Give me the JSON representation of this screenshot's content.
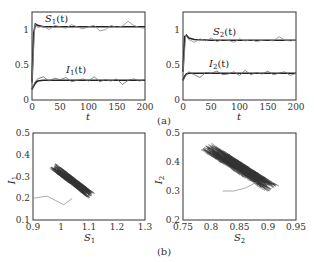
{
  "chart_data": [
    {
      "id": "a-left",
      "type": "line",
      "xlabel": "t",
      "ylabel": "",
      "xlim": [
        0,
        200
      ],
      "ylim": [
        0,
        1.25
      ],
      "xticks": [
        "0",
        "50",
        "100",
        "150",
        "200"
      ],
      "yticks": [
        "0",
        "0.5",
        "1"
      ],
      "annotations": [
        "S1(t)",
        "I1(t)"
      ],
      "series": [
        {
          "name": "S1(t) deterministic",
          "color": "#222222",
          "x": [
            0,
            3,
            6,
            10,
            20,
            50,
            100,
            150,
            200
          ],
          "values": [
            0.25,
            0.95,
            1.08,
            1.06,
            1.04,
            1.04,
            1.04,
            1.04,
            1.04
          ]
        },
        {
          "name": "S1(t) stochastic",
          "color": "#888888",
          "x": [
            0,
            5,
            10,
            20,
            30,
            40,
            50,
            60,
            70,
            80,
            90,
            100,
            110,
            120,
            130,
            140,
            150,
            160,
            170,
            180,
            190,
            200
          ],
          "values": [
            0.25,
            1.08,
            1.03,
            1.05,
            1.0,
            1.06,
            1.04,
            1.02,
            1.07,
            1.04,
            1.01,
            1.04,
            1.06,
            0.98,
            1.0,
            1.06,
            1.03,
            1.05,
            1.12,
            1.06,
            1.03,
            1.02
          ]
        },
        {
          "name": "I1(t) deterministic",
          "color": "#222222",
          "x": [
            0,
            3,
            6,
            10,
            20,
            50,
            100,
            150,
            200
          ],
          "values": [
            0.15,
            0.2,
            0.24,
            0.27,
            0.28,
            0.28,
            0.28,
            0.28,
            0.28
          ]
        },
        {
          "name": "I1(t) stochastic",
          "color": "#666666",
          "x": [
            0,
            5,
            10,
            20,
            30,
            40,
            50,
            60,
            70,
            80,
            90,
            100,
            110,
            120,
            130,
            140,
            150,
            160,
            170,
            180,
            190,
            200
          ],
          "values": [
            0.15,
            0.25,
            0.3,
            0.33,
            0.27,
            0.31,
            0.29,
            0.32,
            0.26,
            0.28,
            0.3,
            0.27,
            0.33,
            0.26,
            0.29,
            0.27,
            0.3,
            0.22,
            0.28,
            0.3,
            0.27,
            0.29
          ]
        }
      ]
    },
    {
      "id": "a-right",
      "type": "line",
      "xlabel": "t",
      "ylabel": "",
      "xlim": [
        0,
        200
      ],
      "ylim": [
        0,
        1.25
      ],
      "xticks": [
        "0",
        "50",
        "100",
        "150",
        "200"
      ],
      "yticks": [
        "0",
        "0.5",
        "1"
      ],
      "annotations": [
        "S2(t)",
        "I2(t)"
      ],
      "series": [
        {
          "name": "S2(t) deterministic",
          "color": "#222222",
          "x": [
            0,
            3,
            6,
            10,
            20,
            50,
            100,
            150,
            200
          ],
          "values": [
            0.4,
            0.9,
            0.92,
            0.88,
            0.86,
            0.85,
            0.85,
            0.85,
            0.85
          ]
        },
        {
          "name": "S2(t) stochastic",
          "color": "#888888",
          "x": [
            0,
            5,
            10,
            20,
            30,
            40,
            50,
            60,
            70,
            80,
            90,
            100,
            110,
            120,
            130,
            140,
            150,
            160,
            170,
            180,
            190,
            200
          ],
          "values": [
            0.4,
            0.92,
            0.86,
            0.82,
            0.87,
            0.84,
            0.88,
            0.83,
            0.86,
            0.85,
            0.82,
            0.87,
            0.84,
            0.86,
            0.83,
            0.85,
            0.86,
            0.84,
            0.9,
            0.85,
            0.84,
            0.85
          ]
        },
        {
          "name": "I2(t) deterministic",
          "color": "#222222",
          "x": [
            0,
            3,
            6,
            10,
            20,
            50,
            100,
            150,
            200
          ],
          "values": [
            0.28,
            0.34,
            0.37,
            0.38,
            0.38,
            0.38,
            0.38,
            0.38,
            0.38
          ]
        },
        {
          "name": "I2(t) stochastic",
          "color": "#666666",
          "x": [
            0,
            5,
            10,
            20,
            30,
            40,
            50,
            60,
            70,
            80,
            90,
            100,
            110,
            120,
            130,
            140,
            150,
            160,
            170,
            180,
            190,
            200
          ],
          "values": [
            0.28,
            0.35,
            0.4,
            0.36,
            0.32,
            0.39,
            0.38,
            0.41,
            0.36,
            0.37,
            0.4,
            0.35,
            0.42,
            0.36,
            0.39,
            0.37,
            0.41,
            0.36,
            0.38,
            0.4,
            0.35,
            0.38
          ]
        }
      ]
    },
    {
      "id": "b-left",
      "type": "scatter",
      "xlabel": "S1",
      "ylabel": "I1",
      "xlim": [
        0.9,
        1.3
      ],
      "ylim": [
        0.1,
        0.5
      ],
      "xticks": [
        "0.9",
        "1",
        "1.1",
        "1.2",
        "1.3"
      ],
      "yticks": [
        "0.1",
        "0.2",
        "0.3",
        "0.4",
        "0.5"
      ],
      "description": "Phase portrait: dense cloud of trajectory centered near (1.04, 0.28), elongated from (0.98, 0.35) to (1.12, 0.21); initial transient from (0.9, 0.2) through (1.01, 0.17)",
      "series": [
        {
          "name": "trajectory cloud center",
          "x": [
            1.04
          ],
          "values": [
            0.28
          ]
        },
        {
          "name": "transient",
          "x": [
            0.9,
            0.95,
            0.98,
            1.01,
            1.04
          ],
          "values": [
            0.2,
            0.21,
            0.19,
            0.17,
            0.2
          ]
        }
      ]
    },
    {
      "id": "b-right",
      "type": "scatter",
      "xlabel": "S2",
      "ylabel": "I2",
      "xlim": [
        0.75,
        0.95
      ],
      "ylim": [
        0.2,
        0.5
      ],
      "xticks": [
        "0.75",
        "0.8",
        "0.85",
        "0.9",
        "0.95"
      ],
      "yticks": [
        "0.2",
        "0.3",
        "0.4",
        "0.5"
      ],
      "description": "Phase portrait: dense cloud centered near (0.85, 0.38), elongated from (0.79, 0.45) to (0.91, 0.31); faint transient near (0.82-0.86, 0.30)",
      "series": [
        {
          "name": "trajectory cloud center",
          "x": [
            0.85
          ],
          "values": [
            0.38
          ]
        },
        {
          "name": "transient",
          "x": [
            0.82,
            0.84,
            0.86,
            0.88
          ],
          "values": [
            0.3,
            0.3,
            0.31,
            0.33
          ]
        }
      ]
    }
  ],
  "labels": {
    "a_left_S": "S",
    "a_left_S_sub": "1",
    "a_left_I": "I",
    "a_left_I_sub": "1",
    "a_right_S": "S",
    "a_right_S_sub": "2",
    "a_right_I": "I",
    "a_right_I_sub": "2",
    "t_arg": "(t)",
    "x_t": "t",
    "b_left_x": "S",
    "b_left_x_sub": "1",
    "b_left_y": "I",
    "b_left_y_sub": "1",
    "b_right_x": "S",
    "b_right_x_sub": "2",
    "b_right_y": "I",
    "b_right_y_sub": "2",
    "panel_a": "(a)",
    "panel_b": "(b)"
  },
  "ticks": {
    "a_x": [
      "0",
      "50",
      "100",
      "150",
      "200"
    ],
    "a_y": [
      "0",
      "0.5",
      "1"
    ],
    "bl_x": [
      "0.9",
      "1",
      "1.1",
      "1.2",
      "1.3"
    ],
    "bl_y": [
      "0.1",
      "0.2",
      "0.3",
      "0.4",
      "0.5"
    ],
    "br_x": [
      "0.75",
      "0.8",
      "0.85",
      "0.9",
      "0.95"
    ],
    "br_y": [
      "0.2",
      "0.3",
      "0.4",
      "0.5"
    ]
  }
}
